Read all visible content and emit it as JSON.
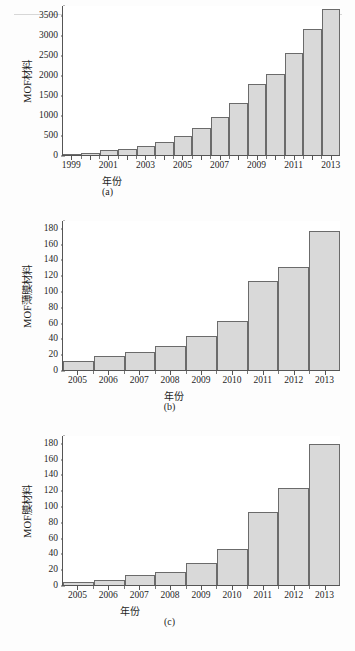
{
  "figure": {
    "panels": [
      "a",
      "b",
      "c"
    ],
    "axis_color": "#555555",
    "bar_fill": "#d9d9d9",
    "bar_stroke": "#6b6b6b"
  },
  "panel_a": {
    "caption": "(a)",
    "xlabel": "年份",
    "ylabel": "MOF材料",
    "yticks": [
      "0",
      "500",
      "1000",
      "1500",
      "2000",
      "2500",
      "3000",
      "3500"
    ],
    "xticks": [
      "1999",
      "2001",
      "2003",
      "2005",
      "2007",
      "2009",
      "2011",
      "2013"
    ]
  },
  "panel_b": {
    "caption": "(b)",
    "xlabel": "年份",
    "ylabel": "MOF薄膜材料",
    "yticks": [
      "0",
      "20",
      "40",
      "60",
      "80",
      "100",
      "120",
      "140",
      "160",
      "180"
    ],
    "xticks": [
      "2005",
      "2006",
      "2007",
      "2008",
      "2009",
      "2010",
      "2011",
      "2012",
      "2013"
    ]
  },
  "panel_c": {
    "caption": "(c)",
    "xlabel": "年份",
    "ylabel": "MOF膜材料",
    "yticks": [
      "0",
      "20",
      "40",
      "60",
      "80",
      "100",
      "120",
      "140",
      "160",
      "180"
    ],
    "xticks": [
      "2005",
      "2006",
      "2007",
      "2008",
      "2009",
      "2010",
      "2011",
      "2012",
      "2013"
    ]
  },
  "chart_data": [
    {
      "type": "bar",
      "panel": "a",
      "title": "",
      "xlabel": "年份",
      "ylabel": "MOF材料",
      "categories": [
        "1999",
        "2000",
        "2001",
        "2002",
        "2003",
        "2004",
        "2005",
        "2006",
        "2007",
        "2008",
        "2009",
        "2010",
        "2011",
        "2012",
        "2013"
      ],
      "values": [
        15,
        50,
        120,
        160,
        215,
        325,
        470,
        680,
        960,
        1300,
        1770,
        2020,
        2560,
        3140,
        3640
      ],
      "ylim": [
        0,
        3750
      ],
      "ytick_values": [
        0,
        500,
        1000,
        1500,
        2000,
        2500,
        3000,
        3500
      ],
      "xtick_labels_shown": [
        "1999",
        "2001",
        "2003",
        "2005",
        "2007",
        "2009",
        "2011",
        "2013"
      ],
      "grid": false,
      "legend": "none"
    },
    {
      "type": "bar",
      "panel": "b",
      "title": "",
      "xlabel": "年份",
      "ylabel": "MOF薄膜材料",
      "categories": [
        "2005",
        "2006",
        "2007",
        "2008",
        "2009",
        "2010",
        "2011",
        "2012",
        "2013"
      ],
      "values": [
        12,
        18,
        23,
        31,
        43,
        62,
        113,
        131,
        176
      ],
      "ylim": [
        0,
        190
      ],
      "ytick_values": [
        0,
        20,
        40,
        60,
        80,
        100,
        120,
        140,
        160,
        180
      ],
      "xtick_labels_shown": [
        "2005",
        "2006",
        "2007",
        "2008",
        "2009",
        "2010",
        "2011",
        "2012",
        "2013"
      ],
      "grid": false,
      "legend": "none"
    },
    {
      "type": "bar",
      "panel": "c",
      "title": "",
      "xlabel": "年份",
      "ylabel": "MOF膜材料",
      "categories": [
        "2005",
        "2006",
        "2007",
        "2008",
        "2009",
        "2010",
        "2011",
        "2012",
        "2013"
      ],
      "values": [
        4,
        6,
        13,
        17,
        28,
        46,
        93,
        123,
        179
      ],
      "ylim": [
        0,
        190
      ],
      "ytick_values": [
        0,
        20,
        40,
        60,
        80,
        100,
        120,
        140,
        160,
        180
      ],
      "xtick_labels_shown": [
        "2005",
        "2006",
        "2007",
        "2008",
        "2009",
        "2010",
        "2011",
        "2012",
        "2013"
      ],
      "grid": false,
      "legend": "none"
    }
  ]
}
